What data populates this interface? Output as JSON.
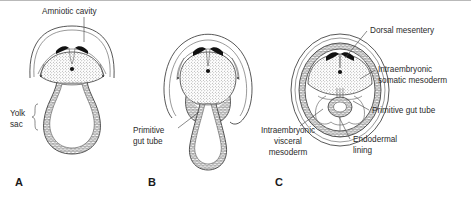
{
  "figure": {
    "title_visible": false,
    "background_color": "#ffffff",
    "ink_color": "#2b2b2b",
    "panel_count": 3
  },
  "panels": [
    {
      "letter": "A",
      "letter_x": 15,
      "letter_y": 186,
      "center_x": 72,
      "center_y": 95,
      "stage_description": "flat embryonic disc with wide open amniotic cavity and large yolk sac",
      "labels": [
        {
          "name": "amniotic-cavity",
          "text": "Amniotic cavity",
          "lines": [
            "Amniotic cavity"
          ],
          "x": 42,
          "y": 14,
          "anchor": "start",
          "leader": [
            [
              84,
              17
            ],
            [
              84,
              42
            ]
          ]
        },
        {
          "name": "yolk-sac",
          "text": "Yolk sac",
          "lines": [
            "Yolk",
            "sac"
          ],
          "x": 10,
          "y": 116,
          "anchor": "start",
          "brace": true
        }
      ]
    },
    {
      "letter": "B",
      "letter_x": 148,
      "letter_y": 186,
      "center_x": 207,
      "center_y": 95,
      "stage_description": "lateral body folds closing, amnion expanding around embryo, gut tube narrowing to yolk stalk",
      "labels": [
        {
          "name": "primitive-gut-tube",
          "text": "Primitive gut tube",
          "lines": [
            "Primitive",
            "gut tube"
          ],
          "x": 133,
          "y": 133,
          "anchor": "start",
          "leader": [
            [
              178,
              130
            ],
            [
              199,
              112
            ]
          ]
        }
      ]
    },
    {
      "letter": "C",
      "letter_x": 275,
      "letter_y": 186,
      "center_x": 340,
      "center_y": 90,
      "stage_description": "body folds fused, gut tube enclosed within body cavity, amnion surrounds embryo",
      "labels": [
        {
          "name": "dorsal-mesentery",
          "text": "Dorsal mesentery",
          "lines": [
            "Dorsal mesentery"
          ],
          "x": 370,
          "y": 33,
          "anchor": "start",
          "leader": [
            [
              367,
              31
            ],
            [
              345,
              58
            ]
          ]
        },
        {
          "name": "intraembryonic-somatic-mesoderm",
          "text": "Intraembryonic somatic mesoderm",
          "lines": [
            "Intraembryonic",
            "somatic mesoderm"
          ],
          "x": 378,
          "y": 72,
          "anchor": "start",
          "leader": [
            [
              375,
              70
            ],
            [
              358,
              80
            ]
          ]
        },
        {
          "name": "primitive-gut-tube-c",
          "text": "Primitive gut tube",
          "lines": [
            "Primitive gut tube"
          ],
          "x": 372,
          "y": 113,
          "anchor": "start",
          "leader": [
            [
              369,
              110
            ],
            [
              352,
              101
            ]
          ]
        },
        {
          "name": "endodermal-lining",
          "text": "Endodermal lining",
          "lines": [
            "Endodermal",
            "lining"
          ],
          "x": 353,
          "y": 142,
          "anchor": "start",
          "leader": [
            [
              350,
              139
            ],
            [
              338,
              118
            ]
          ]
        },
        {
          "name": "intraembryonic-visceral-mesoderm",
          "text": "Intraembryonic visceral mesoderm",
          "lines": [
            "Intraembryonic",
            "visceral",
            "mesoderm"
          ],
          "x": 288,
          "y": 133,
          "anchor": "middle",
          "leader": [
            [
              300,
              126
            ],
            [
              322,
              108
            ]
          ]
        }
      ]
    }
  ],
  "structures": {
    "neural_plate_color": "#111111",
    "mesoderm_fill": "stippled",
    "endoderm_fill": "cross-hatch",
    "amnion_stroke": "#3a3a3a"
  }
}
